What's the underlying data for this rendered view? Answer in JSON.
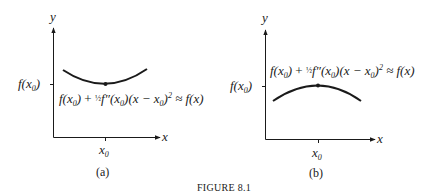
{
  "figure": {
    "caption": "FIGURE 8.1",
    "panels": [
      {
        "id": "a",
        "label": "(a)",
        "y_axis_label": "y",
        "x_axis_label": "x",
        "y_tick_label": "f(x0)",
        "x_tick_label": "x0",
        "curve": "concave up (minimum at x0)",
        "formula": "f(x0) + ½f″(x0)(x − x0)² ≈ f(x)"
      },
      {
        "id": "b",
        "label": "(b)",
        "y_axis_label": "y",
        "x_axis_label": "x",
        "y_tick_label": "f(x0)",
        "x_tick_label": "x0",
        "curve": "concave down (maximum at x0)",
        "formula": "f(x0) + ½f″(x0)(x − x0)² ≈ f(x)"
      }
    ]
  },
  "text": {
    "a_label": "(a)",
    "b_label": "(b)",
    "caption": "FIGURE 8.1",
    "y": "y",
    "x": "x",
    "f_open": "f(x",
    "sub0": "0",
    "close": ")",
    "plus_half": " + ",
    "half": "½",
    "fpp": "f″(x",
    "mid": ")(x − x",
    "sq": "2",
    "approx_fx": " ≈ f(x)",
    "x0_x": "x"
  },
  "colors": {
    "ink": "#1a1a1a",
    "background": "#ffffff"
  }
}
